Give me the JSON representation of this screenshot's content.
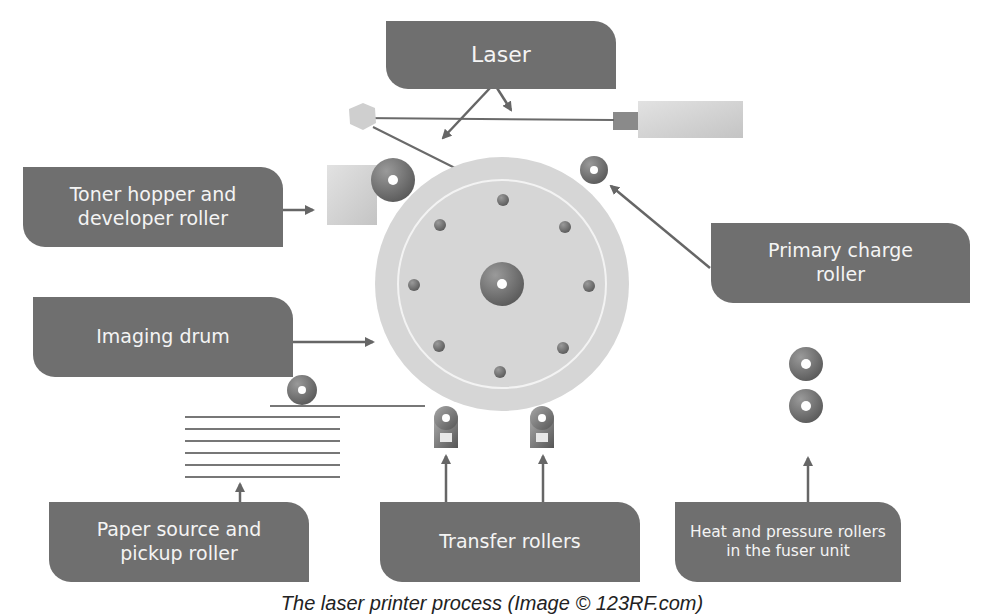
{
  "labels": {
    "laser": "Laser",
    "toner": "Toner hopper and\ndeveloper roller",
    "primary_charge": "Primary charge\nroller",
    "imaging_drum": "Imaging drum",
    "paper_source": "Paper source and\npickup roller",
    "transfer": "Transfer rollers",
    "fuser": "Heat and pressure rollers\nin the fuser unit"
  },
  "caption": "The laser printer process (Image © 123RF.com)",
  "colors": {
    "label_bg": "#6f6f6f",
    "label_text": "#f4f4f4",
    "drum": "#d4d4d4",
    "arrow": "#666666",
    "roller_dark": "#5e5e5e",
    "roller_light": "#bdbdbd"
  }
}
